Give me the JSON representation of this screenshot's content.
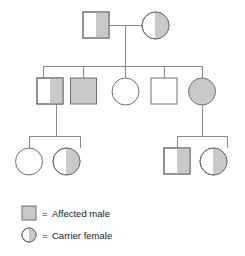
{
  "diagram": {
    "type": "pedigree-chart",
    "title": "",
    "colors": {
      "stroke": "#6e6e6e",
      "line": "#808080",
      "fill_shaded": "#c9c9c9",
      "fill_empty": "#ffffff",
      "text": "#1a1a1a",
      "background": "#ffffff"
    },
    "symbol_legend": {
      "square": "male",
      "circle": "female",
      "full_shade": "affected",
      "half_shade": "carrier",
      "no_shade": "unaffected"
    },
    "generations": [
      {
        "id": "I",
        "label": "",
        "members": [
          {
            "id": "I-1",
            "shape": "square",
            "sex": "male",
            "status": "half-shaded",
            "meaning": "carrier male"
          },
          {
            "id": "I-2",
            "shape": "circle",
            "sex": "female",
            "status": "half-shaded",
            "meaning": "carrier female"
          }
        ]
      },
      {
        "id": "II",
        "label": "",
        "members": [
          {
            "id": "II-1",
            "shape": "square",
            "sex": "male",
            "status": "half-shaded",
            "meaning": "carrier male"
          },
          {
            "id": "II-2",
            "shape": "square",
            "sex": "male",
            "status": "shaded",
            "meaning": "affected male"
          },
          {
            "id": "II-3",
            "shape": "circle",
            "sex": "female",
            "status": "empty",
            "meaning": "unaffected female"
          },
          {
            "id": "II-4",
            "shape": "square",
            "sex": "male",
            "status": "empty",
            "meaning": "unaffected male"
          },
          {
            "id": "II-5",
            "shape": "circle",
            "sex": "female",
            "status": "shaded",
            "meaning": "affected female"
          }
        ]
      },
      {
        "id": "III",
        "label": "",
        "members": [
          {
            "id": "III-1",
            "shape": "circle",
            "sex": "female",
            "status": "empty",
            "meaning": "unaffected female"
          },
          {
            "id": "III-2",
            "shape": "circle",
            "sex": "female",
            "status": "half-shaded",
            "meaning": "carrier female"
          },
          {
            "id": "III-3",
            "shape": "square",
            "sex": "male",
            "status": "half-shaded",
            "meaning": "carrier male"
          },
          {
            "id": "III-4",
            "shape": "circle",
            "sex": "female",
            "status": "half-shaded",
            "meaning": "carrier female"
          }
        ]
      }
    ],
    "legend": {
      "items": [
        {
          "key": "affected-male",
          "symbol": "shaded-square",
          "equals": "=",
          "label": "Affected male"
        },
        {
          "key": "carrier-female",
          "symbol": "half-shaded-circle",
          "equals": "=",
          "label": "Carrier female"
        }
      ]
    }
  }
}
